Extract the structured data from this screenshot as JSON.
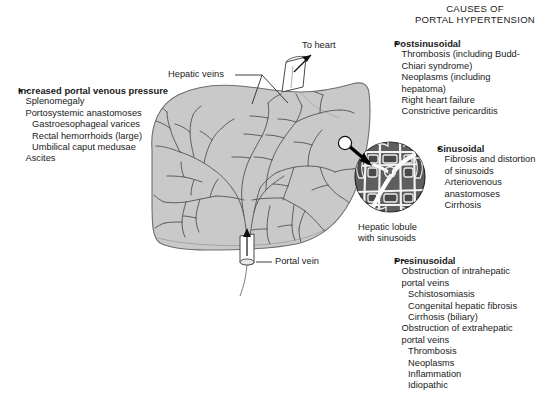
{
  "title": {
    "line1": "CAUSES OF",
    "line2": "PORTAL HYPERTENSION"
  },
  "left_panel": {
    "heading": "Increased portal venous pressure",
    "items": [
      {
        "type": "bullet",
        "text": "Splenomegaly"
      },
      {
        "type": "bullet",
        "text": "Portosystemic anastomoses"
      },
      {
        "type": "dash",
        "text": "Gastroesophageal varices"
      },
      {
        "type": "dash",
        "text": "Rectal hemorrhoids (large)"
      },
      {
        "type": "dash",
        "text": "Umbilical caput medusae"
      },
      {
        "type": "bullet",
        "text": "Ascites"
      }
    ]
  },
  "postsinusoidal": {
    "heading": "Postsinusoidal",
    "items": [
      {
        "type": "bullet",
        "text": "Thrombosis (including Budd-"
      },
      {
        "type": "cont",
        "text": "Chiari syndrome)"
      },
      {
        "type": "bullet",
        "text": "Neoplasms (including"
      },
      {
        "type": "cont",
        "text": "hepatoma)"
      },
      {
        "type": "bullet",
        "text": "Right heart failure"
      },
      {
        "type": "bullet",
        "text": "Constrictive pericarditis"
      }
    ]
  },
  "sinusoidal": {
    "heading": "Sinusoidal",
    "items": [
      {
        "type": "bullet",
        "text": "Fibrosis and distortion"
      },
      {
        "type": "cont",
        "text": "of sinusoids"
      },
      {
        "type": "bullet",
        "text": "Arteriovenous"
      },
      {
        "type": "cont",
        "text": "anastomoses"
      },
      {
        "type": "bullet",
        "text": "Cirrhosis"
      }
    ]
  },
  "presinusoidal": {
    "heading": "Presinusoidal",
    "items": [
      {
        "type": "bullet",
        "text": "Obstruction of intrahepatic"
      },
      {
        "type": "cont",
        "text": "portal veins"
      },
      {
        "type": "dash",
        "text": "Schistosomiasis"
      },
      {
        "type": "dash",
        "text": "Congenital hepatic fibrosis"
      },
      {
        "type": "dash",
        "text": "Cirrhosis (biliary)"
      },
      {
        "type": "bullet",
        "text": "Obstruction of extrahepatic"
      },
      {
        "type": "cont",
        "text": "portal veins"
      },
      {
        "type": "dash",
        "text": "Thrombosis"
      },
      {
        "type": "dash",
        "text": "Neoplasms"
      },
      {
        "type": "dash",
        "text": "Inflammation"
      },
      {
        "type": "dash",
        "text": "Idiopathic"
      }
    ]
  },
  "diagram_labels": {
    "to_heart": "To heart",
    "hepatic_veins": "Hepatic veins",
    "portal_vein": "Portal vein",
    "hepatic_lobule_line1": "Hepatic lobule",
    "hepatic_lobule_line2": "with sinusoids"
  },
  "colors": {
    "liver_fill": "#c9c9c9",
    "liver_stroke": "#6e6e6e",
    "lobule_fill": "#5a5a5a",
    "lobule_channel": "#ffffff",
    "arrow": "#000000",
    "text": "#1a1a1a",
    "background": "#ffffff"
  }
}
